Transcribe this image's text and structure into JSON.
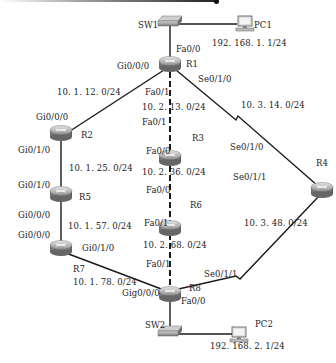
{
  "diagram": {
    "type": "network-topology",
    "devices": [
      {
        "id": "SW1",
        "label": "SW1",
        "kind": "switch"
      },
      {
        "id": "PC1",
        "label": "PC1",
        "kind": "pc",
        "ip": "192. 168. 1. 1/24"
      },
      {
        "id": "R1",
        "label": "R1",
        "kind": "router"
      },
      {
        "id": "R2",
        "label": "R2",
        "kind": "router"
      },
      {
        "id": "R3",
        "label": "R3",
        "kind": "router"
      },
      {
        "id": "R4",
        "label": "R4",
        "kind": "router"
      },
      {
        "id": "R5",
        "label": "R5",
        "kind": "router"
      },
      {
        "id": "R6",
        "label": "R6",
        "kind": "router"
      },
      {
        "id": "R7",
        "label": "R7",
        "kind": "router"
      },
      {
        "id": "R8",
        "label": "R8",
        "kind": "router"
      },
      {
        "id": "SW2",
        "label": "SW2",
        "kind": "switch"
      },
      {
        "id": "PC2",
        "label": "PC2",
        "kind": "pc",
        "ip": "192. 168. 2. 1/24"
      }
    ],
    "links": [
      {
        "from": "SW1",
        "to": "PC1",
        "style": "solid"
      },
      {
        "from": "SW1",
        "to": "R1",
        "style": "solid",
        "iface_to": "Fa0/0"
      },
      {
        "from": "R1",
        "to": "R2",
        "style": "solid",
        "network": "10. 1. 12. 0/24",
        "iface_from": "Gi0/0/0",
        "iface_to": "Gi0/0/0"
      },
      {
        "from": "R1",
        "to": "R3",
        "style": "dashed",
        "network": "10. 2. 13. 0/24",
        "iface_from": "Fa0/1",
        "iface_to": "Fa0/1"
      },
      {
        "from": "R1",
        "to": "R4",
        "style": "serial",
        "network": "10. 3. 14. 0/24",
        "iface_from": "Se0/1/0",
        "iface_to": "Se0/1/0"
      },
      {
        "from": "R2",
        "to": "R5",
        "style": "solid",
        "network": "10. 1. 25. 0/24",
        "iface_from": "Gi0/1/0",
        "iface_to": "Gi0/1/0"
      },
      {
        "from": "R3",
        "to": "R6",
        "style": "dashed",
        "network": "10. 2. 36. 0/24",
        "iface_from": "Fa0/0",
        "iface_to": "Fa0/0"
      },
      {
        "from": "R4",
        "to": "R8",
        "style": "serial",
        "network": "10. 3. 48. 0/24",
        "iface_from": "Se0/1/1",
        "iface_to": "Se0/1/1"
      },
      {
        "from": "R5",
        "to": "R7",
        "style": "solid",
        "network": "10. 1. 57. 0/24",
        "iface_from": "Gi0/0/0",
        "iface_to": "Gi0/0/0"
      },
      {
        "from": "R6",
        "to": "R8",
        "style": "dashed",
        "network": "10. 2. 68. 0/24",
        "iface_from": "Fa0/1",
        "iface_to": "Fa0/1"
      },
      {
        "from": "R7",
        "to": "R8",
        "style": "solid",
        "network": "10. 1. 78. 0/24",
        "iface_from": "Gi0/1/0",
        "iface_to": "Gig0/0/0"
      },
      {
        "from": "R8",
        "to": "SW2",
        "style": "solid",
        "iface_from": "Fa0/0"
      },
      {
        "from": "SW2",
        "to": "PC2",
        "style": "solid"
      }
    ]
  },
  "labels": {
    "sw1": "SW1",
    "pc1": "PC1",
    "pc1_ip": "192. 168. 1. 1/24",
    "r1": "R1",
    "r2": "R2",
    "r3": "R3",
    "r4": "R4",
    "r5": "R5",
    "r6": "R6",
    "r7": "R7",
    "r8": "R8",
    "sw2": "SW2",
    "pc2": "PC2",
    "pc2_ip": "192. 168. 2. 1/24",
    "r1_fa00": "Fa0/0",
    "r1_gi000": "Gi0/0/0",
    "r1_se010": "Se0/1/0",
    "r1_fa01": "Fa0/1",
    "net_12": "10. 1. 12. 0/24",
    "net_13": "10. 2. 13. 0/24",
    "net_14": "10. 3. 14. 0/24",
    "r2_gi000": "Gi0/0/0",
    "r2_gi010": "Gi0/1/0",
    "r3_fa01": "Fa0/1",
    "r3_fa00": "Fa0/0",
    "r4_se010": "Se0/1/0",
    "r4_se011": "Se0/1/1",
    "net_25": "10. 1. 25. 0/24",
    "net_36": "10. 2. 36. 0/24",
    "r5_gi010": "Gi0/1/0",
    "r5_gi000": "Gi0/0/0",
    "r6_fa00": "Fa0/0",
    "r6_fa01": "Fa0/1",
    "net_57": "10. 1. 57. 0/24",
    "net_48": "10. 3. 48. 0/24",
    "r7_gi000": "Gi0/0/0",
    "r7_gi010": "Gi0/1/0",
    "net_68": "10. 2. 68. 0/24",
    "net_78": "10. 1. 78. 0/24",
    "r8_fa01": "Fa0/1",
    "r8_se011": "Se0/1/1",
    "r8_gig000": "Gig0/0/0",
    "r8_fa00": "Fa0/0"
  }
}
